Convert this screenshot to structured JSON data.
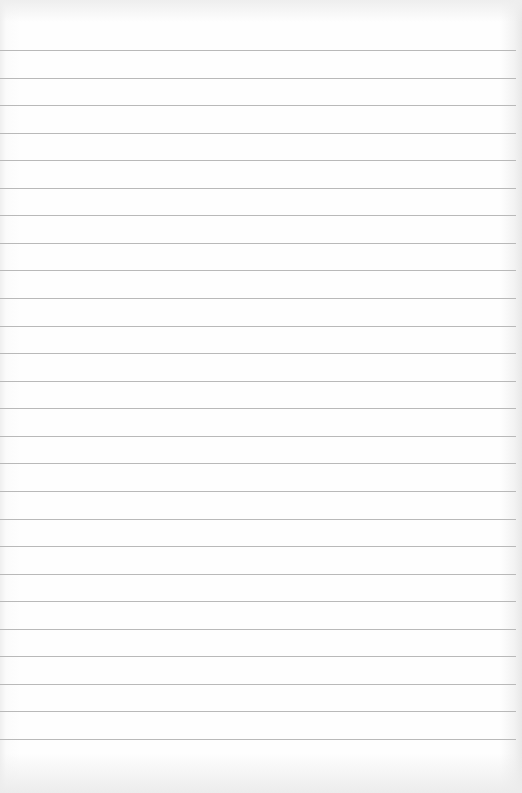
{
  "page": {
    "type": "blank lined paper",
    "background_color": "#fdfdfd",
    "line_color": "#b9b9b9",
    "line_count": 26,
    "first_line_y": 50,
    "line_spacing": 27.56
  }
}
